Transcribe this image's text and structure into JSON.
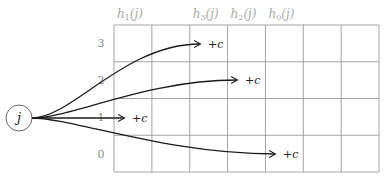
{
  "diagram": {
    "node": {
      "label": "j",
      "cx": 19,
      "cy": 118,
      "r": 13
    },
    "grid": {
      "left": 114,
      "top": 25,
      "cols": 7,
      "rows": 4,
      "col_width": 37.86,
      "row_height": 36.75,
      "line_color": "#9a9a9a"
    },
    "column_headers": [
      {
        "label": "h1(j)",
        "base": "h",
        "sub": "1",
        "arg": "(j)",
        "col": 0
      },
      {
        "label": "h3(j)",
        "base": "h",
        "sub": "3",
        "arg": "(j)",
        "col": 2
      },
      {
        "label": "h2(j)",
        "base": "h",
        "sub": "2",
        "arg": "(j)",
        "col": 3
      },
      {
        "label": "h0(j)",
        "base": "h",
        "sub": "0",
        "arg": "(j)",
        "col": 4
      }
    ],
    "row_labels": [
      {
        "label": "3",
        "row": 0
      },
      {
        "label": "2",
        "row": 1
      },
      {
        "label": "1",
        "row": 2
      },
      {
        "label": "0",
        "row": 3
      }
    ],
    "arrows": [
      {
        "row_label": "3",
        "target_col": 2,
        "end_x": 200,
        "end_y": 44,
        "annotation": "+c"
      },
      {
        "row_label": "2",
        "target_col": 3,
        "end_x": 237,
        "end_y": 80,
        "annotation": "+c"
      },
      {
        "row_label": "1",
        "target_col": 0,
        "end_x": 124,
        "end_y": 118,
        "annotation": "+c"
      },
      {
        "row_label": "0",
        "target_col": 4,
        "end_x": 275,
        "end_y": 154,
        "annotation": "+c"
      }
    ],
    "arrow_color": "#1a1a1a"
  }
}
